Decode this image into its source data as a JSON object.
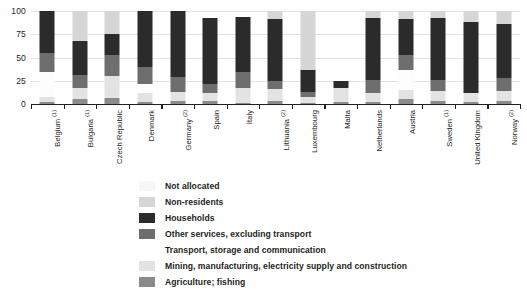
{
  "chart_data": {
    "type": "bar",
    "subtype": "stacked-bar-100",
    "title": "",
    "xlabel": "",
    "ylabel": "",
    "ylim": [
      0,
      100
    ],
    "yticks": [
      0,
      25,
      50,
      75,
      100
    ],
    "ytick_labels": [
      "0",
      "25",
      "50",
      "75",
      "100"
    ],
    "grid": true,
    "legend_position": "bottom",
    "categories": [
      "Belgium (¹)",
      "Bulgaria (¹)",
      "Czech Republic",
      "Denmark",
      "Germany (²)",
      "Spain",
      "Italy",
      "Lithuania (²)",
      "Luxembourg",
      "Malta",
      "Netherlands",
      "Austria",
      "Sweden (¹)",
      "United Kingdom",
      "Norway (²)"
    ],
    "category_labels_plain": [
      "Belgium",
      "Bulgaria",
      "Czech Republic",
      "Denmark",
      "Germany",
      "Spain",
      "Italy",
      "Lithuania",
      "Luxembourg",
      "Malta",
      "Netherlands",
      "Austria",
      "Sweden",
      "United Kingdom",
      "Norway"
    ],
    "category_footnotes": [
      "1",
      "1",
      "",
      "",
      "2",
      "",
      "",
      "2",
      "",
      "",
      "",
      "",
      "1",
      "",
      "2"
    ],
    "series": [
      {
        "name": "Agriculture; fishing",
        "color": "#8a8a8a",
        "values": [
          2,
          5,
          6,
          2,
          3,
          3,
          1,
          3,
          1,
          2,
          2,
          5,
          3,
          2,
          3
        ]
      },
      {
        "name": "Mining, manufacturing, electricity supply and construction",
        "color": "#e3e3e3",
        "values": [
          6,
          12,
          24,
          10,
          10,
          9,
          16,
          13,
          7,
          15,
          10,
          10,
          11,
          10,
          11
        ]
      },
      {
        "name": "Transport, storage and communication",
        "color": "#fbfbfb",
        "values": [
          26,
          0,
          0,
          10,
          0,
          0,
          0,
          0,
          0,
          0,
          0,
          22,
          0,
          0,
          0
        ]
      },
      {
        "name": "Other services, excluding transport",
        "color": "#6e6e6e",
        "values": [
          21,
          14,
          23,
          18,
          16,
          10,
          17,
          9,
          5,
          0,
          14,
          16,
          12,
          0,
          14
        ]
      },
      {
        "name": "Households",
        "color": "#2b2b2b",
        "values": [
          45,
          37,
          22,
          60,
          71,
          70,
          60,
          66,
          24,
          8,
          66,
          38,
          66,
          76,
          58
        ]
      },
      {
        "name": "Non-residents",
        "color": "#d6d6d6",
        "values": [
          0,
          32,
          25,
          0,
          0,
          0,
          0,
          9,
          63,
          0,
          8,
          9,
          8,
          12,
          14
        ]
      },
      {
        "name": "Not allocated",
        "color": "#f7f7f7",
        "values": [
          0,
          0,
          0,
          0,
          0,
          0,
          0,
          0,
          0,
          0,
          0,
          0,
          0,
          0,
          0
        ]
      }
    ],
    "legend_entries": [
      "Not allocated",
      "Non-residents",
      "Households",
      "Other services, excluding transport",
      "Transport, storage and communication",
      "Mining, manufacturing, electricity supply and construction",
      "Agriculture; fishing"
    ],
    "legend_colors": [
      "#f7f7f7",
      "#d6d6d6",
      "#2b2b2b",
      "#6e6e6e",
      "#ffffff",
      "#e3e3e3",
      "#8a8a8a"
    ],
    "axis_color": "#231f20",
    "grid_color": "#e3e3e3",
    "background": "#ffffff"
  }
}
